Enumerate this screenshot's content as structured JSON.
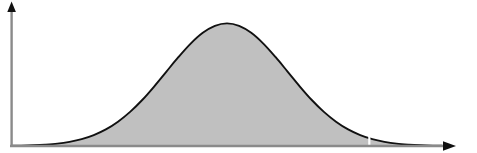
{
  "chart_data": {
    "type": "area",
    "title": "",
    "subtitle": "",
    "xlabel": "",
    "ylabel": "",
    "legend": [],
    "annotations": [],
    "grid": false,
    "xtick_labels": [],
    "ytick_labels": [],
    "xlim": [
      -3.55,
      3.55
    ],
    "ylim": [
      0,
      1.06
    ],
    "series": [
      {
        "name": "normal-density",
        "fill": "#c0c0c0",
        "stroke": "#111111",
        "x": [
          -3.55,
          -3.4,
          -3.2,
          -3.0,
          -2.8,
          -2.6,
          -2.4,
          -2.2,
          -2.0,
          -1.8,
          -1.6,
          -1.4,
          -1.2,
          -1.0,
          -0.8,
          -0.6,
          -0.4,
          -0.2,
          0.0,
          0.2,
          0.4,
          0.6,
          0.8,
          1.0,
          1.2,
          1.4,
          1.6,
          1.8,
          2.0,
          2.2,
          2.4,
          2.6,
          2.8,
          3.0,
          3.2,
          3.4,
          3.55
        ],
        "values": [
          0.002,
          0.003,
          0.006,
          0.011,
          0.019,
          0.034,
          0.056,
          0.089,
          0.135,
          0.198,
          0.278,
          0.375,
          0.487,
          0.607,
          0.726,
          0.835,
          0.923,
          0.98,
          1.0,
          0.98,
          0.923,
          0.835,
          0.726,
          0.607,
          0.487,
          0.375,
          0.278,
          0.198,
          0.135,
          0.089,
          0.056,
          0.034,
          0.019,
          0.011,
          0.006,
          0.003,
          0.002
        ]
      }
    ],
    "markers": [
      {
        "name": "vertical-cut-line",
        "orientation": "vertical",
        "x": 2.35,
        "color": "#ffffff",
        "width_px": 2,
        "spans_full_height": true
      }
    ],
    "axes": {
      "x_axis": {
        "color": "#8a8a8a",
        "arrow": true,
        "arrow_color": "#111111",
        "position_px": 146,
        "start_px": 10,
        "end_px": 455
      },
      "y_axis": {
        "color": "#8a8a8a",
        "arrow": true,
        "arrow_color": "#111111",
        "position_px": 12,
        "top_px": 4,
        "bottom_px": 146
      }
    },
    "colors": {
      "fill": "#c0c0c0",
      "curve_stroke": "#111111",
      "axis": "#8a8a8a",
      "arrow": "#111111",
      "cut_line": "#ffffff",
      "background": "#ffffff"
    }
  }
}
